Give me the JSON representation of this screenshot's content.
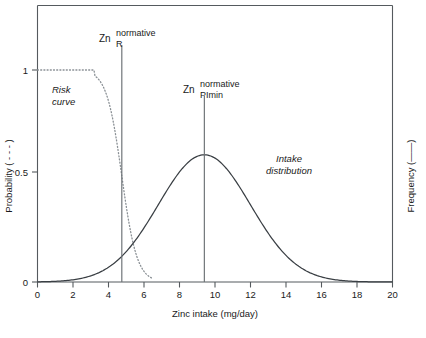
{
  "figure": {
    "background": "#ffffff",
    "ink": "#1a1a1a"
  },
  "axes": {
    "x_title": "Zinc intake (mg/day)",
    "y_left_title": "Probability ( - - - )",
    "y_right_title": "Frequency (——)",
    "x_ticks": [
      "0",
      "2",
      "4",
      "6",
      "8",
      "10",
      "12",
      "14",
      "16",
      "18",
      "20"
    ],
    "y_ticks": [
      "0",
      "0.5",
      "1"
    ]
  },
  "markers": {
    "risk": {
      "symbol": "Zn",
      "superscript": "normative",
      "subscript": "R",
      "x_value": 4.75
    },
    "plmin": {
      "symbol": "Zn",
      "superscript": "normative",
      "subscript": "PImin",
      "x_value": 9.4
    }
  },
  "annotations": {
    "risk_curve_line1": "Risk",
    "risk_curve_line2": "curve",
    "intake_line1": "Intake",
    "intake_line2": "distribution"
  },
  "chart_data": {
    "type": "line",
    "title": "",
    "xlabel": "Zinc intake (mg/day)",
    "ylabel": "Probability ( - - - )",
    "ylabel_right": "Frequency (——)",
    "xlim": [
      0,
      20
    ],
    "ylim": [
      0,
      1.15
    ],
    "grid": false,
    "legend": "none",
    "xticks": [
      0,
      2,
      4,
      6,
      8,
      10,
      12,
      14,
      16,
      18,
      20
    ],
    "yticks": [
      0,
      0.5,
      1
    ],
    "series": [
      {
        "name": "Risk curve",
        "style": "dotted",
        "color": "#8a9095",
        "axis": "left",
        "description": "Sigmoid decreasing probability of inadequacy; plateau at 1.0 up to ~3.3 mg/day, midpoint (0.5) at 4.75 mg/day, reaching 0 near 6.1 mg/day",
        "x": [
          0.0,
          1.0,
          2.0,
          3.0,
          3.3,
          3.6,
          3.9,
          4.2,
          4.45,
          4.75,
          5.0,
          5.25,
          5.5,
          5.75,
          6.0,
          6.1,
          6.5,
          7.0,
          8.0
        ],
        "y": [
          1.0,
          1.0,
          1.0,
          0.995,
          0.985,
          0.955,
          0.89,
          0.76,
          0.63,
          0.5,
          0.37,
          0.26,
          0.165,
          0.095,
          0.035,
          0.015,
          0.0,
          0.0,
          0.0
        ]
      },
      {
        "name": "Intake distribution",
        "style": "solid",
        "color": "#3a3f44",
        "axis": "right",
        "description": "Normal-shaped frequency distribution of zinc intake, mean 9.4 mg/day, peak height 0.60 on the left-axis scale, standard deviation ~2.6 mg/day",
        "mean": 9.4,
        "sd": 2.6,
        "peak": 0.6,
        "x": [
          0.0,
          1.0,
          2.0,
          3.0,
          4.0,
          4.75,
          5.0,
          6.0,
          7.0,
          8.0,
          9.0,
          9.4,
          10.0,
          11.0,
          12.0,
          13.0,
          14.0,
          15.0,
          16.0,
          17.0,
          18.0,
          19.0,
          20.0
        ],
        "y": [
          0.0,
          0.002,
          0.008,
          0.025,
          0.065,
          0.105,
          0.125,
          0.22,
          0.35,
          0.48,
          0.585,
          0.6,
          0.585,
          0.48,
          0.35,
          0.22,
          0.125,
          0.063,
          0.028,
          0.011,
          0.004,
          0.001,
          0.0
        ]
      }
    ],
    "vertical_lines": [
      {
        "label": "Zn_R^normative",
        "x": 4.75,
        "y_top": 1.12,
        "y_bottom": 0
      },
      {
        "label": "Zn_PImin^normative",
        "x": 9.4,
        "y_top": 0.85,
        "y_bottom": 0
      }
    ]
  }
}
